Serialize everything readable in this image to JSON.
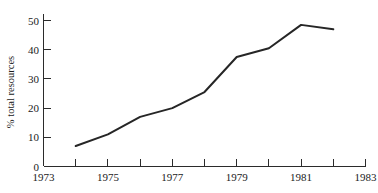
{
  "chart_data": {
    "type": "line",
    "title": "",
    "subtitle": "",
    "xlabel": "",
    "ylabel": "% total resources",
    "x": [
      1974,
      1975,
      1976,
      1977,
      1978,
      1979,
      1980,
      1981,
      1982
    ],
    "values": [
      7,
      11,
      17,
      20,
      25.5,
      37.5,
      40.5,
      48.5,
      47
    ],
    "series": [
      {
        "name": "% total resources",
        "x": [
          1974,
          1975,
          1976,
          1977,
          1978,
          1979,
          1980,
          1981,
          1982
        ],
        "values": [
          7,
          11,
          17,
          20,
          25.5,
          37.5,
          40.5,
          48.5,
          47
        ]
      }
    ],
    "xlim": [
      1973,
      1983
    ],
    "ylim": [
      0,
      52
    ],
    "x_ticks": [
      1973,
      1974,
      1975,
      1976,
      1977,
      1978,
      1979,
      1980,
      1981,
      1982,
      1983
    ],
    "x_tick_labels": [
      "1973",
      "",
      "1975",
      "",
      "1977",
      "",
      "1979",
      "",
      "1981",
      "",
      "1983"
    ],
    "y_ticks": [
      0,
      10,
      20,
      30,
      40,
      50
    ],
    "y_tick_labels": [
      "0",
      "10",
      "20",
      "30",
      "40",
      "50"
    ],
    "grid": false,
    "legend": false,
    "legend_position": "none",
    "line_color": "#262626",
    "axis_color": "#2b2b2b",
    "background_color": "#ffffff",
    "annotations": []
  },
  "axes": {
    "y_title": "% total resources",
    "y_labels": [
      "50",
      "40",
      "30",
      "20",
      "10",
      "0"
    ],
    "x_labels": [
      "1973",
      "1975",
      "1977",
      "1979",
      "1981",
      "1983"
    ]
  }
}
